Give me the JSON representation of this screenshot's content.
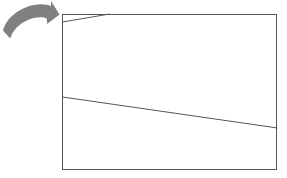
{
  "canvas": {
    "width": 287,
    "height": 178,
    "background_color": "#ffffff"
  },
  "diagram": {
    "title": "",
    "stroke_color": "#555555",
    "stroke_width": 1,
    "arrow_color": "#808080",
    "shapes": {
      "rectangle": {
        "name": "main-rectangle",
        "x": 62,
        "y": 14,
        "width": 215,
        "height": 156,
        "fill": "none",
        "stroke": "#555555"
      },
      "upper_line": {
        "name": "upper-diagonal-line",
        "x1": 62,
        "y1": 22,
        "x2": 109,
        "y2": 14,
        "stroke": "#555555"
      },
      "lower_line": {
        "name": "lower-diagonal-line",
        "x1": 62,
        "y1": 97,
        "x2": 277,
        "y2": 128,
        "stroke": "#555555"
      },
      "arrow": {
        "name": "curved-arrow",
        "fill": "#808080",
        "direction": "up-right",
        "tail_x": 3,
        "tail_y": 32,
        "tip_x": 59,
        "tip_y": 17
      }
    }
  }
}
